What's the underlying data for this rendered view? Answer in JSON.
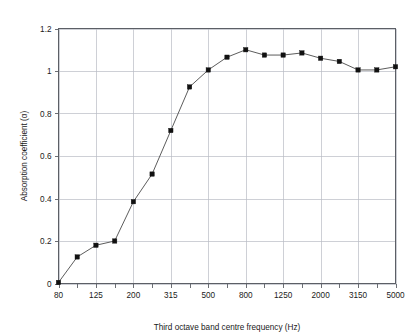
{
  "chart_data": {
    "type": "line",
    "title": "",
    "xlabel": "Third octave band centre frequency (Hz)",
    "ylabel": "Absorption coefficient (α)",
    "grid": true,
    "legend": null,
    "xscale": "third-octave-band (categorical log)",
    "x_tick_labels": [
      "80",
      "125",
      "200",
      "315",
      "500",
      "800",
      "1250",
      "2000",
      "3150",
      "5000"
    ],
    "y_tick_labels": [
      "0",
      "0.2",
      "0.4",
      "0.6",
      "0.8",
      "1",
      "1.2"
    ],
    "ylim": [
      0,
      1.2
    ],
    "yticks": [
      0,
      0.2,
      0.4,
      0.6,
      0.8,
      1.0,
      1.2
    ],
    "categories": [
      "80",
      "100",
      "125",
      "160",
      "200",
      "250",
      "315",
      "400",
      "500",
      "630",
      "800",
      "1000",
      "1250",
      "1600",
      "2000",
      "2500",
      "3150",
      "4000",
      "5000"
    ],
    "values": [
      0.005,
      0.125,
      0.18,
      0.2,
      0.385,
      0.515,
      0.72,
      0.925,
      1.005,
      1.065,
      1.1,
      1.075,
      1.075,
      1.085,
      1.06,
      1.045,
      1.005,
      1.005,
      1.02
    ],
    "series": [
      {
        "name": "Absorption coefficient",
        "marker": "square",
        "marker_color": "#111111",
        "line_color": "#4a4a4a",
        "points": [
          {
            "x": "80",
            "y": 0.005
          },
          {
            "x": "100",
            "y": 0.125
          },
          {
            "x": "125",
            "y": 0.18
          },
          {
            "x": "160",
            "y": 0.2
          },
          {
            "x": "200",
            "y": 0.385
          },
          {
            "x": "250",
            "y": 0.515
          },
          {
            "x": "315",
            "y": 0.72
          },
          {
            "x": "400",
            "y": 0.925
          },
          {
            "x": "500",
            "y": 1.005
          },
          {
            "x": "630",
            "y": 1.065
          },
          {
            "x": "800",
            "y": 1.1
          },
          {
            "x": "1000",
            "y": 1.075
          },
          {
            "x": "1250",
            "y": 1.075
          },
          {
            "x": "1600",
            "y": 1.085
          },
          {
            "x": "2000",
            "y": 1.06
          },
          {
            "x": "2500",
            "y": 1.045
          },
          {
            "x": "3150",
            "y": 1.005
          },
          {
            "x": "4000",
            "y": 1.005
          },
          {
            "x": "5000",
            "y": 1.02
          }
        ]
      }
    ]
  },
  "colors": {
    "background": "#ffffff",
    "grid": "#b9bcc4",
    "frame": "#5c5f66",
    "line": "#4a4a4a",
    "marker": "#111111",
    "text": "#1a1a1a"
  },
  "axes": {
    "x_label": "Third octave band centre frequency (Hz)",
    "y_label": "Absorption coefficient (α)",
    "y_ticks": [
      {
        "label": "1.2",
        "value": 1.2
      },
      {
        "label": "1",
        "value": 1.0
      },
      {
        "label": "0.8",
        "value": 0.8
      },
      {
        "label": "0.6",
        "value": 0.6
      },
      {
        "label": "0.4",
        "value": 0.4
      },
      {
        "label": "0.2",
        "value": 0.2
      },
      {
        "label": "0",
        "value": 0
      }
    ],
    "x_ticks": [
      {
        "label": "80",
        "index": 0
      },
      {
        "label": "125",
        "index": 2
      },
      {
        "label": "200",
        "index": 4
      },
      {
        "label": "315",
        "index": 6
      },
      {
        "label": "500",
        "index": 8
      },
      {
        "label": "800",
        "index": 10
      },
      {
        "label": "1250",
        "index": 12
      },
      {
        "label": "2000",
        "index": 14
      },
      {
        "label": "3150",
        "index": 16
      },
      {
        "label": "5000",
        "index": 18
      }
    ]
  }
}
